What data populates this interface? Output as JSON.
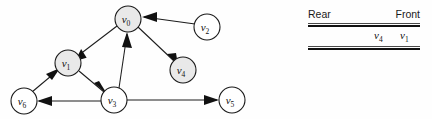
{
  "figure": {
    "background_color": "#fefefe",
    "stroke_color": "#1a1a1a",
    "shaded_node_color": "#e9e9e9",
    "plain_node_color": "#ffffff"
  },
  "graph": {
    "type": "directed-graph",
    "nodes": [
      {
        "id": "v0",
        "base": "v",
        "sub": "0",
        "cx": 128,
        "cy": 19,
        "r": 13,
        "shaded": true
      },
      {
        "id": "v1",
        "base": "v",
        "sub": "1",
        "cx": 68,
        "cy": 63,
        "r": 13,
        "shaded": true
      },
      {
        "id": "v2",
        "base": "v",
        "sub": "2",
        "cx": 207,
        "cy": 27,
        "r": 13,
        "shaded": false
      },
      {
        "id": "v3",
        "base": "v",
        "sub": "3",
        "cx": 114,
        "cy": 100,
        "r": 13,
        "shaded": false
      },
      {
        "id": "v4",
        "base": "v",
        "sub": "4",
        "cx": 183,
        "cy": 70,
        "r": 13,
        "shaded": true
      },
      {
        "id": "v5",
        "base": "v",
        "sub": "5",
        "cx": 232,
        "cy": 100,
        "r": 13,
        "shaded": false
      },
      {
        "id": "v6",
        "base": "v",
        "sub": "6",
        "cx": 24,
        "cy": 101,
        "r": 13,
        "shaded": false
      }
    ],
    "edges": [
      {
        "from": "v0",
        "to": "v1",
        "directed": true
      },
      {
        "from": "v0",
        "to": "v4",
        "directed": true
      },
      {
        "from": "v2",
        "to": "v0",
        "directed": true
      },
      {
        "from": "v3",
        "to": "v0",
        "directed": true
      },
      {
        "from": "v1",
        "to": "v3",
        "directed": true
      },
      {
        "from": "v6",
        "to": "v1",
        "directed": true
      },
      {
        "from": "v3",
        "to": "v6",
        "directed": true
      },
      {
        "from": "v3",
        "to": "v5",
        "directed": true
      }
    ]
  },
  "queue": {
    "title": "",
    "header": {
      "rear_label": "Rear",
      "front_label": "Front"
    },
    "columns": [
      "rear-slot",
      "front-slot"
    ],
    "cells": [
      {
        "base": "v",
        "sub": "4",
        "x": 66
      },
      {
        "base": "v",
        "sub": "1",
        "x": 92
      }
    ]
  }
}
